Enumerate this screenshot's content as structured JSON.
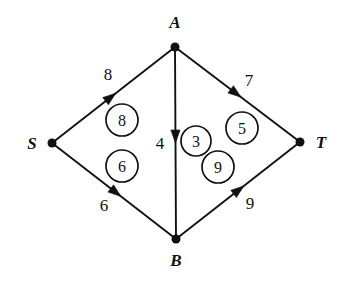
{
  "figure": {
    "kind": "flow-network-diagram",
    "background_color": "#ffffff",
    "ink_color": "#111111"
  },
  "nodes": [
    {
      "id": "S",
      "label": "S",
      "x": 52,
      "y": 143,
      "label_x": 32,
      "label_y": 149
    },
    {
      "id": "A",
      "label": "A",
      "x": 175,
      "y": 47,
      "label_x": 175,
      "label_y": 28
    },
    {
      "id": "B",
      "label": "B",
      "x": 176,
      "y": 239,
      "label_x": 176,
      "label_y": 266
    },
    {
      "id": "T",
      "label": "T",
      "x": 300,
      "y": 142,
      "label_x": 321,
      "label_y": 148
    }
  ],
  "edges": [
    {
      "id": "S-A",
      "from": "S",
      "to": "A",
      "capacity": "8",
      "flow": "8",
      "capacity_label_x": 108,
      "capacity_label_y": 80,
      "flow_circle_x": 122,
      "flow_circle_y": 120,
      "flow_circle_r": 16,
      "arrow_t": 0.52
    },
    {
      "id": "S-B",
      "from": "S",
      "to": "B",
      "capacity": "6",
      "flow": "6",
      "capacity_label_x": 104,
      "capacity_label_y": 211,
      "flow_circle_x": 122,
      "flow_circle_y": 166,
      "flow_circle_r": 16,
      "arrow_t": 0.56
    },
    {
      "id": "A-B",
      "from": "A",
      "to": "B",
      "capacity": "4",
      "flow": "3",
      "capacity_label_x": 160,
      "capacity_label_y": 149,
      "flow_circle_x": 196,
      "flow_circle_y": 141,
      "flow_circle_r": 15,
      "arrow_t": 0.5
    },
    {
      "id": "A-T",
      "from": "A",
      "to": "T",
      "capacity": "7",
      "flow": "5",
      "capacity_label_x": 249,
      "capacity_label_y": 86,
      "flow_circle_x": 242,
      "flow_circle_y": 128,
      "flow_circle_r": 16,
      "arrow_t": 0.53
    },
    {
      "id": "B-T",
      "from": "B",
      "to": "T",
      "capacity": "9",
      "flow": "9",
      "capacity_label_x": 250,
      "capacity_label_y": 209,
      "flow_circle_x": 218,
      "flow_circle_y": 167,
      "flow_circle_r": 16,
      "arrow_t": 0.55
    }
  ]
}
